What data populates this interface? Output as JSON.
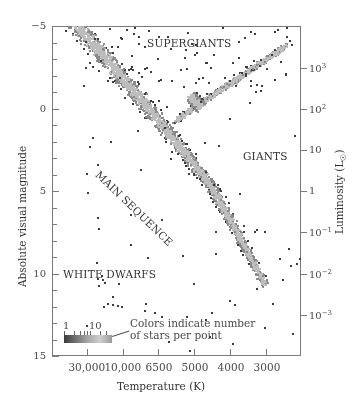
{
  "chart_data": {
    "type": "scatter",
    "xlabel": "Temperature (K)",
    "ylabel": "Absolute visual magnitude",
    "y2label": "Luminosity (L☉)",
    "x_axis": {
      "direction": "decreasing",
      "tick_labels": [
        "30,000",
        "10,000",
        "6500",
        "5000",
        "4000",
        "3000"
      ]
    },
    "y_axis": {
      "range": [
        15,
        -5
      ],
      "inverted": true,
      "major_ticks": [
        -5,
        0,
        5,
        10,
        15
      ],
      "minor_step": 1
    },
    "y2_axis": {
      "ticks": [
        "10^3",
        "10^2",
        "10",
        "1",
        "10^-1",
        "10^-2",
        "10^-3"
      ]
    },
    "grid": false,
    "annotations": [
      "SUPERGIANTS",
      "GIANTS",
      "MAIN SEQUENCE",
      "WHITE DWARFS"
    ],
    "legend": {
      "text_line1": "Colors indicate number",
      "text_line2": "of stars per point",
      "scale_labels": [
        "1",
        "10"
      ],
      "position": "lower-left"
    },
    "regions": [
      {
        "name": "main sequence",
        "from_temp_K": 30000,
        "to_temp_K": 2800,
        "from_mag": -2,
        "to_mag": 14,
        "density": "high"
      },
      {
        "name": "giant branch",
        "temp_K_range": [
          5500,
          3200
        ],
        "mag_range": [
          -3,
          3
        ],
        "density": "medium"
      },
      {
        "name": "red clump",
        "temp_K": 4800,
        "mag": 0.7,
        "density": "high"
      },
      {
        "name": "supergiants",
        "temp_K_range": [
          30000,
          3000
        ],
        "mag_range": [
          -5,
          -3
        ],
        "density": "sparse"
      },
      {
        "name": "white dwarfs",
        "temp_K_range": [
          30000,
          10000
        ],
        "mag_range": [
          10.5,
          12
        ],
        "density": "sparse"
      }
    ]
  },
  "axes": {
    "y_left": [
      {
        "label": "−5",
        "y": 26
      },
      {
        "label": "0",
        "y": 109
      },
      {
        "label": "5",
        "y": 191
      },
      {
        "label": "10",
        "y": 274
      },
      {
        "label": "15",
        "y": 356
      }
    ],
    "y_right": [
      {
        "base": "10",
        "exp": "3",
        "y": 68
      },
      {
        "base": "10",
        "exp": "2",
        "y": 109
      },
      {
        "base": "10",
        "exp": "",
        "y": 150
      },
      {
        "base": "1",
        "exp": "",
        "y": 191
      },
      {
        "base": "10",
        "exp": "−1",
        "y": 232
      },
      {
        "base": "10",
        "exp": "−2",
        "y": 274
      },
      {
        "base": "10",
        "exp": "−3",
        "y": 315
      }
    ],
    "x": [
      {
        "label": "30,000",
        "x": 87
      },
      {
        "label": "10,000",
        "x": 123
      },
      {
        "label": "6500",
        "x": 158
      },
      {
        "label": "5000",
        "x": 194
      },
      {
        "label": "4000",
        "x": 230
      },
      {
        "label": "3000",
        "x": 266
      }
    ],
    "x_title": "Temperature (K)",
    "y_title": "Absolute visual magnitude",
    "y2_title_main": "Luminosity (L",
    "y2_title_sub": "☉",
    "y2_title_end": ")"
  },
  "labels": {
    "supergiants": "SUPERGIANTS",
    "giants": "GIANTS",
    "main_sequence": "MAIN SEQUENCE",
    "white_dwarfs": "WHITE DWARFS"
  },
  "legend": {
    "scale_1": "1",
    "scale_10": "10",
    "text_line1": "Colors indicate number",
    "text_line2": "of stars per point"
  },
  "colors": {
    "dense_core": "#bdbdbd",
    "mid": "#8a8a8a",
    "sparse_edge": "#3c3c3c",
    "axis": "#7a7a7a"
  },
  "scatter_clusters": [
    {
      "cx": [
        18,
        220
      ],
      "cy": [
        -8,
        240
      ],
      "spread": 9,
      "n": 2600,
      "kind": "ms"
    },
    {
      "cx": [
        125,
        232
      ],
      "cy": [
        92,
        20
      ],
      "spread": 10,
      "n": 1500,
      "kind": "giant"
    },
    {
      "cx": [
        138,
        148
      ],
      "cy": [
        70,
        80
      ],
      "spread": 8,
      "n": 600,
      "kind": "clump"
    },
    {
      "box": [
        30,
        0,
        240,
        60
      ],
      "n": 90,
      "kind": "sparse"
    },
    {
      "box": [
        30,
        60,
        249,
        330
      ],
      "n": 70,
      "kind": "sparse"
    },
    {
      "box": [
        45,
        245,
        100,
        285
      ],
      "n": 12,
      "kind": "sparse"
    }
  ]
}
